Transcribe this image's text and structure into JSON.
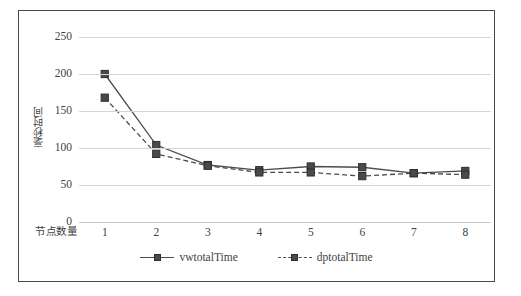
{
  "chart_data": {
    "type": "line",
    "title": "",
    "xlabel": "节点数量",
    "ylabel": "毫秒时间",
    "x": [
      1,
      2,
      3,
      4,
      5,
      6,
      7,
      8
    ],
    "categories": [
      "1",
      "2",
      "3",
      "4",
      "5",
      "6",
      "7",
      "8"
    ],
    "series": [
      {
        "name": "vwtotalTime",
        "style": "solid",
        "color": "#4c4c4c",
        "marker": "square",
        "values": [
          200,
          104,
          77,
          70,
          75,
          74,
          66,
          69
        ]
      },
      {
        "name": "dptotalTime",
        "style": "dashed",
        "color": "#4c4c4c",
        "marker": "square",
        "values": [
          168,
          92,
          76,
          67,
          67,
          62,
          66,
          64
        ]
      }
    ],
    "ylim": [
      0,
      250
    ],
    "yticks": [
      0,
      50,
      100,
      150,
      200,
      250
    ],
    "ytick_labels": [
      "0",
      "50",
      "100",
      "150",
      "200",
      "250"
    ],
    "xlim": [
      0.5,
      8.5
    ],
    "grid": "horizontal",
    "legend_position": "bottom",
    "plot_background": "#ffffff",
    "gridline_color": "#d6d6d6",
    "border_color": "#4a4a4a"
  },
  "legend": {
    "entries": [
      {
        "label": "vwtotalTime"
      },
      {
        "label": "dptotalTime"
      }
    ]
  }
}
